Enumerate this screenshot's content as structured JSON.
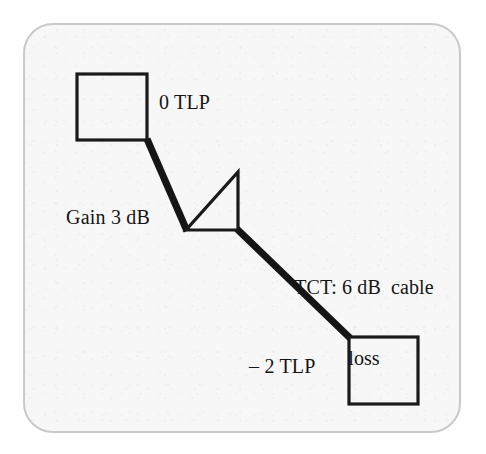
{
  "figure": {
    "type": "diagram",
    "frame": {
      "shape": "rounded-rectangle",
      "border_color": "#c9c9c9",
      "fill_color": "#f7f7f7"
    },
    "ink_color": "#151515",
    "labels": {
      "source_level": "0 TLP",
      "amplifier_gain": "Gain 3 dB",
      "cable_line1": "TCT: 6 dB  cable",
      "cable_line2": "loss",
      "destination_level": "– 2 TLP"
    },
    "nodes": [
      {
        "name": "source-block",
        "shape": "square",
        "x": 76,
        "y": 73,
        "w": 71,
        "h": 67,
        "label": "0 TLP"
      },
      {
        "name": "amplifier",
        "shape": "triangle",
        "apex_x": 186,
        "apex_y": 230,
        "top_x": 238,
        "top_y": 172,
        "base_x": 238,
        "base_y": 230,
        "label": "Gain 3 dB"
      },
      {
        "name": "destination-block",
        "shape": "square",
        "x": 348,
        "y": 336,
        "w": 70,
        "h": 68,
        "label": "– 2 TLP"
      }
    ],
    "links": [
      {
        "name": "source-to-amplifier",
        "x1": 147,
        "y1": 139,
        "x2": 187,
        "y2": 230,
        "stroke": 7
      },
      {
        "name": "amplifier-to-destination",
        "x1": 238,
        "y1": 230,
        "x2": 349,
        "y2": 337,
        "stroke": 7,
        "label": "TCT: 6 dB  cable loss"
      }
    ]
  }
}
